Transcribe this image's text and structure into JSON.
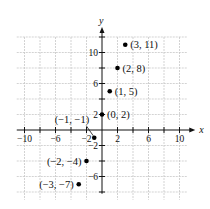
{
  "chart_data": {
    "type": "scatter",
    "title": "",
    "xlabel": "x",
    "ylabel": "y",
    "xlim": [
      -11,
      11
    ],
    "ylim": [
      -9,
      12
    ],
    "grid": true,
    "x_ticks": [
      -10,
      -6,
      -2,
      2,
      6,
      10
    ],
    "y_ticks": [
      10,
      6,
      2,
      -2,
      -6
    ],
    "points": [
      {
        "x": 3,
        "y": 11,
        "label": "(3, 11)"
      },
      {
        "x": 2,
        "y": 8,
        "label": "(2, 8)"
      },
      {
        "x": 1,
        "y": 5,
        "label": "(1, 5)"
      },
      {
        "x": 0,
        "y": 2,
        "label": "(0, 2)"
      },
      {
        "x": -1,
        "y": -1,
        "label": "(−1, −1)"
      },
      {
        "x": -2,
        "y": -4,
        "label": "(−2, −4)"
      },
      {
        "x": -3,
        "y": -7,
        "label": "(−3, −7)"
      }
    ]
  },
  "colors": {
    "axis": "#111111",
    "grid": "#c8c8c8",
    "point": "#000000"
  }
}
